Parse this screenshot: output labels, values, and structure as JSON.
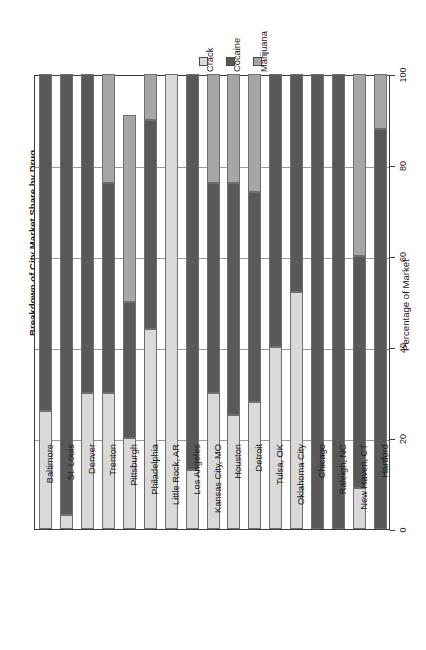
{
  "chart_data": {
    "type": "bar",
    "stacked": true,
    "orientation": "rotated-90",
    "title": "Breakdown of City Market Share by Drug",
    "xlabel": "",
    "ylabel": "Percentage of Market",
    "ylim": [
      0,
      100
    ],
    "yticks": [
      0,
      20,
      40,
      60,
      80,
      100
    ],
    "grid": true,
    "legend_position": "top-center",
    "legend": [
      "Crack",
      "Cocaine",
      "Marijuana"
    ],
    "colors": {
      "Crack": "#d9d9d9",
      "Cocaine": "#595959",
      "Marijuana": "#a6a6a6"
    },
    "categories": [
      "Baltimore",
      "St. Louis",
      "Denver",
      "Trenton",
      "Pittsburgh",
      "Philadelphia",
      "Little Rock, AR",
      "Los Angeles",
      "Kansas City, MO",
      "Houston",
      "Detroit",
      "Tulsa, OK",
      "Oklahoma City",
      "Chicago",
      "Raleigh, NC",
      "New Haven, CT",
      "Hartford"
    ],
    "series": [
      {
        "name": "Crack",
        "values": [
          26,
          3,
          30,
          30,
          20,
          44,
          100,
          13,
          30,
          25,
          28,
          40,
          52,
          0,
          0,
          9,
          0
        ]
      },
      {
        "name": "Cocaine",
        "values": [
          74,
          97,
          70,
          46,
          30,
          46,
          0,
          87,
          46,
          51,
          46,
          60,
          48,
          100,
          100,
          51,
          88
        ]
      },
      {
        "name": "Marijuana",
        "values": [
          0,
          0,
          0,
          24,
          41,
          10,
          0,
          0,
          24,
          24,
          26,
          0,
          0,
          0,
          0,
          40,
          12
        ]
      }
    ]
  }
}
